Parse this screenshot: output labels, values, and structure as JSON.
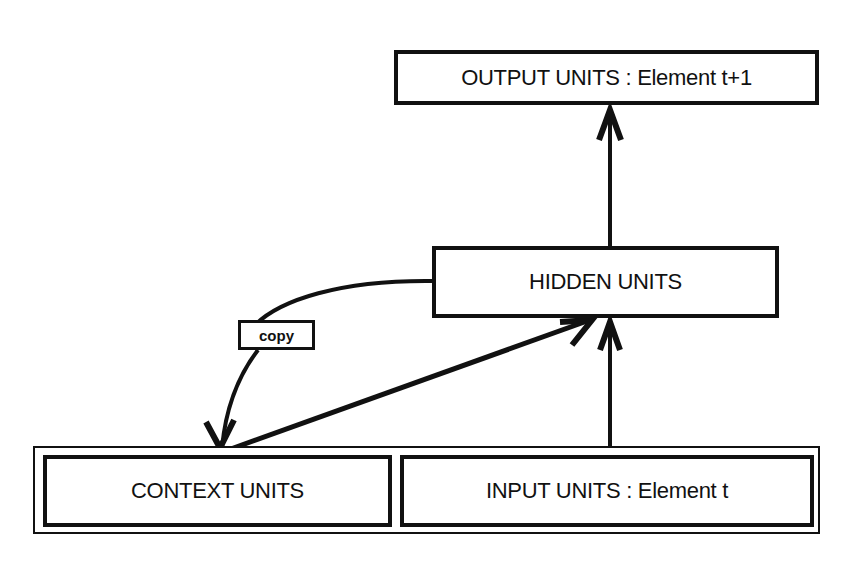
{
  "diagram": {
    "nodes": {
      "output": {
        "label": "OUTPUT UNITS : Element t+1"
      },
      "hidden": {
        "label": "HIDDEN UNITS"
      },
      "context": {
        "label": "CONTEXT UNITS"
      },
      "input": {
        "label": "INPUT UNITS : Element t"
      }
    },
    "edges": [
      {
        "from": "hidden",
        "to": "output",
        "label": ""
      },
      {
        "from": "input",
        "to": "hidden",
        "label": ""
      },
      {
        "from": "context",
        "to": "hidden",
        "label": ""
      },
      {
        "from": "hidden",
        "to": "context",
        "label": "copy"
      }
    ],
    "edge_label_copy": "copy",
    "colors": {
      "stroke": "#111111",
      "background": "#ffffff"
    }
  }
}
